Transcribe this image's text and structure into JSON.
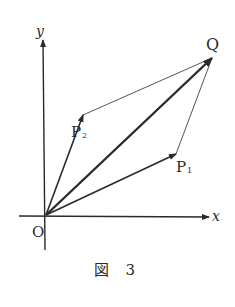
{
  "figure": {
    "caption": "図 3",
    "labels": {
      "origin": "O",
      "x_axis": "x",
      "y_axis": "y",
      "p1": "P",
      "p1_sub": "1",
      "p2": "P",
      "p2_sub": "2",
      "q": "Q"
    },
    "points": {
      "O": [
        46,
        215
      ],
      "P1": [
        176,
        154
      ],
      "P2": [
        83,
        115
      ],
      "Q": [
        213,
        57
      ]
    },
    "vectors": [
      {
        "from": "O",
        "to": "P1",
        "style": "arrow"
      },
      {
        "from": "O",
        "to": "P2",
        "style": "arrow"
      },
      {
        "from": "O",
        "to": "Q",
        "style": "arrow-bold"
      }
    ],
    "segments": [
      {
        "from": "P2",
        "to": "Q",
        "style": "thin"
      },
      {
        "from": "P1",
        "to": "Q",
        "style": "thin"
      }
    ],
    "colors": {
      "ink": "#2a2a2a",
      "background": "#ffffff"
    }
  }
}
